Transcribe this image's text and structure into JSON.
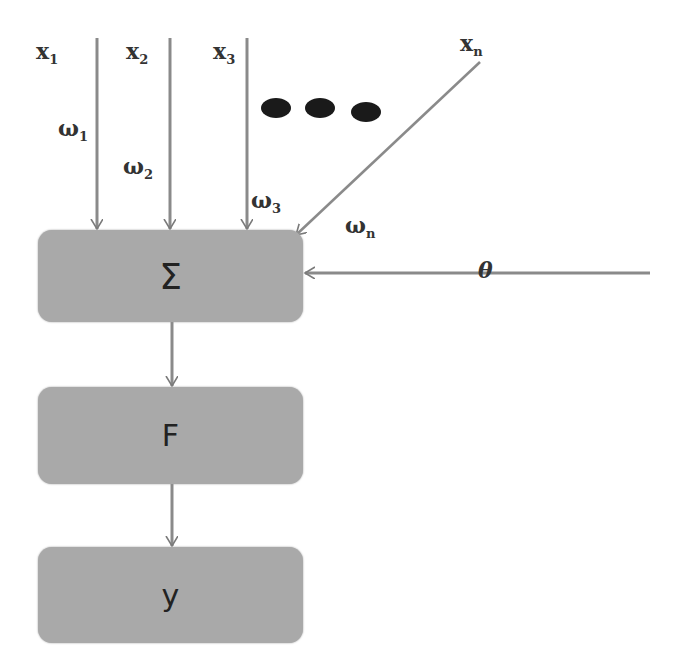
{
  "diagram": {
    "type": "artificial-neuron-model",
    "inputs": [
      {
        "name": "x",
        "sub": "1",
        "weight": "ω",
        "weight_sub": "1"
      },
      {
        "name": "x",
        "sub": "2",
        "weight": "ω",
        "weight_sub": "2"
      },
      {
        "name": "x",
        "sub": "3",
        "weight": "ω",
        "weight_sub": "3"
      },
      {
        "name": "x",
        "sub": "n",
        "weight": "ω",
        "weight_sub": "n"
      }
    ],
    "ellipsis": "●●●",
    "bias": "θ",
    "nodes": {
      "sum": "Σ",
      "activation": "F",
      "output": "y"
    },
    "colors": {
      "box_fill": "#a9a9a9",
      "arrow": "#7a7a7a",
      "text": "#333333",
      "dots": "#1a1a1a"
    }
  }
}
